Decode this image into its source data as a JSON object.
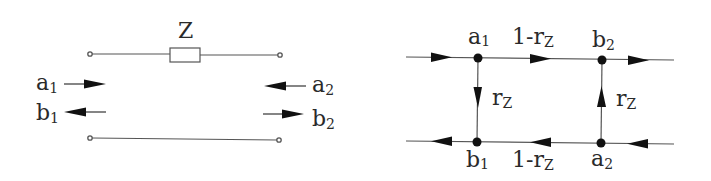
{
  "left_diagram": {
    "impedance_label": "Z",
    "port1": {
      "incident": {
        "main": "a",
        "sub": "1"
      },
      "reflected": {
        "main": "b",
        "sub": "1"
      }
    },
    "port2": {
      "incident": {
        "main": "a",
        "sub": "2"
      },
      "reflected": {
        "main": "b",
        "sub": "2"
      }
    }
  },
  "right_diagram": {
    "nodes": {
      "a1": {
        "main": "a",
        "sub": "1"
      },
      "b2": {
        "main": "b",
        "sub": "2"
      },
      "b1": {
        "main": "b",
        "sub": "1"
      },
      "a2": {
        "main": "a",
        "sub": "2"
      }
    },
    "branches": {
      "top_transmission": {
        "main": "1-r",
        "sub": "Z"
      },
      "bottom_transmission": {
        "main": "1-r",
        "sub": "Z"
      },
      "left_reflection": {
        "main": "r",
        "sub": "Z"
      },
      "right_reflection": {
        "main": "r",
        "sub": "Z"
      }
    }
  }
}
